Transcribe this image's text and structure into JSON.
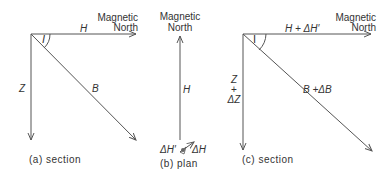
{
  "panels": {
    "a": {
      "north_label_1": "Magnetic",
      "north_label_2": "North",
      "h_label": "H",
      "z_label": "Z",
      "b_label": "B",
      "angle_label": "I",
      "caption": "(a) section"
    },
    "b": {
      "north_label_1": "Magnetic",
      "north_label_2": "North",
      "h_label": "H",
      "dh_prime_label": "ΔH′",
      "dh_label": "ΔH",
      "caption": "(b) plan"
    },
    "c": {
      "north_label_1": "Magnetic",
      "north_label_2": "North",
      "h_label": "H + ΔH′",
      "z_label_1": "Z",
      "z_label_2": "+",
      "z_label_3": "ΔZ",
      "b_label": "B +ΔB",
      "angle_label": "I",
      "caption": "(c) section"
    }
  },
  "colors": {
    "line": "#555555",
    "text": "#333333"
  }
}
